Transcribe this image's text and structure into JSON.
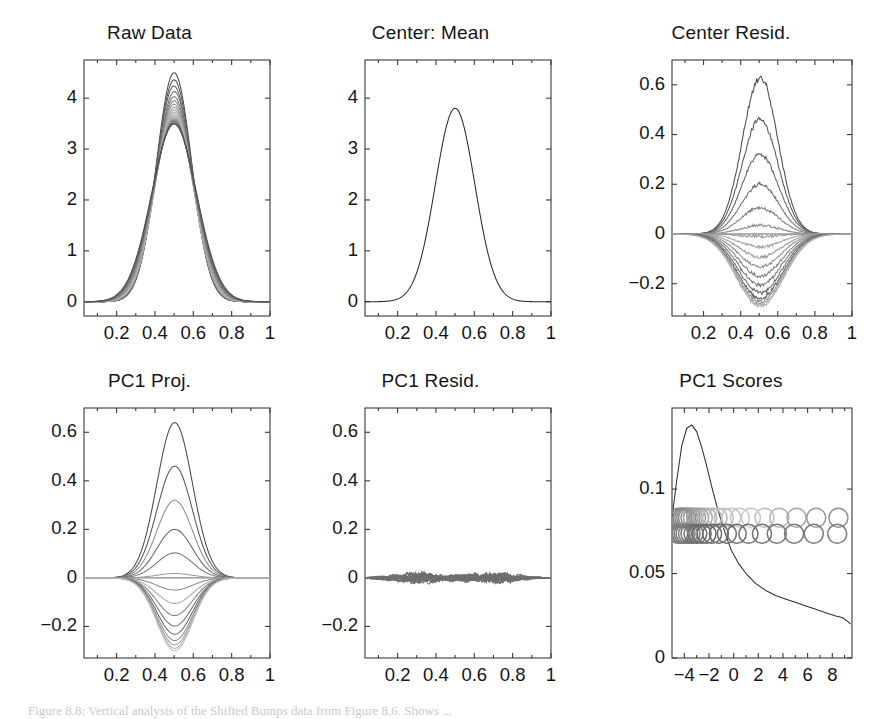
{
  "figure": {
    "caption": "Figure 8.8: Vertical analysis of the Shifted Bumps data from Figure 8.6. Shows ..."
  },
  "chart_data": [
    {
      "id": "raw-data",
      "type": "line",
      "title": "Raw Data",
      "xlabel": "",
      "ylabel": "",
      "xlim": [
        0.03,
        1.0
      ],
      "ylim": [
        -0.28,
        4.75
      ],
      "xticks": [
        0.2,
        0.4,
        0.6,
        0.8,
        1
      ],
      "xticklabels": [
        "0.2",
        "0.4",
        "0.6",
        "0.8",
        "1"
      ],
      "yticks": [
        0,
        1,
        2,
        3,
        4
      ],
      "yticklabels": [
        "0",
        "1",
        "2",
        "3",
        "4"
      ],
      "minor_xticks": [
        0.1,
        0.3,
        0.5,
        0.7,
        0.9
      ],
      "grid": false,
      "legend": "none",
      "description": "Family of ~20 overlapping Gaussian-like bump curves centered at x=0.5, peak heights ranging 3.5 to 4.5, baseline 0.",
      "series": [
        {
          "name": "curve01",
          "peak": 4.5,
          "center": 0.5,
          "width": 0.092,
          "gray": "#4a4a4a"
        },
        {
          "name": "curve02",
          "peak": 4.36,
          "center": 0.5,
          "width": 0.093,
          "gray": "#555555"
        },
        {
          "name": "curve03",
          "peak": 4.24,
          "center": 0.499,
          "width": 0.094,
          "gray": "#626262"
        },
        {
          "name": "curve04",
          "peak": 4.13,
          "center": 0.501,
          "width": 0.095,
          "gray": "#6e6e6e"
        },
        {
          "name": "curve05",
          "peak": 4.03,
          "center": 0.5,
          "width": 0.096,
          "gray": "#7a7a7a"
        },
        {
          "name": "curve06",
          "peak": 3.95,
          "center": 0.5,
          "width": 0.097,
          "gray": "#868686"
        },
        {
          "name": "curve07",
          "peak": 3.88,
          "center": 0.499,
          "width": 0.098,
          "gray": "#929292"
        },
        {
          "name": "curve08",
          "peak": 3.82,
          "center": 0.501,
          "width": 0.099,
          "gray": "#9d9d9d"
        },
        {
          "name": "curve09",
          "peak": 3.77,
          "center": 0.5,
          "width": 0.1,
          "gray": "#a8a8a8"
        },
        {
          "name": "curve10",
          "peak": 3.73,
          "center": 0.5,
          "width": 0.101,
          "gray": "#b3b3b3"
        },
        {
          "name": "curve11",
          "peak": 3.7,
          "center": 0.5,
          "width": 0.102,
          "gray": "#bcbcbc"
        },
        {
          "name": "curve12",
          "peak": 3.67,
          "center": 0.5,
          "width": 0.103,
          "gray": "#b0b0b0"
        },
        {
          "name": "curve13",
          "peak": 3.64,
          "center": 0.5,
          "width": 0.104,
          "gray": "#a4a4a4"
        },
        {
          "name": "curve14",
          "peak": 3.61,
          "center": 0.5,
          "width": 0.106,
          "gray": "#989898"
        },
        {
          "name": "curve15",
          "peak": 3.58,
          "center": 0.5,
          "width": 0.108,
          "gray": "#8c8c8c"
        },
        {
          "name": "curve16",
          "peak": 3.56,
          "center": 0.5,
          "width": 0.11,
          "gray": "#808080"
        },
        {
          "name": "curve17",
          "peak": 3.54,
          "center": 0.5,
          "width": 0.112,
          "gray": "#747474"
        },
        {
          "name": "curve18",
          "peak": 3.52,
          "center": 0.5,
          "width": 0.114,
          "gray": "#686868"
        },
        {
          "name": "curve19",
          "peak": 3.5,
          "center": 0.5,
          "width": 0.116,
          "gray": "#5c5c5c"
        },
        {
          "name": "curve20",
          "peak": 3.49,
          "center": 0.5,
          "width": 0.118,
          "gray": "#4f4f4f"
        }
      ]
    },
    {
      "id": "center-mean",
      "type": "line",
      "title": "Center: Mean",
      "xlabel": "",
      "ylabel": "",
      "xlim": [
        0.03,
        1.0
      ],
      "ylim": [
        -0.28,
        4.75
      ],
      "xticks": [
        0.2,
        0.4,
        0.6,
        0.8,
        1
      ],
      "xticklabels": [
        "0.2",
        "0.4",
        "0.6",
        "0.8",
        "1"
      ],
      "yticks": [
        0,
        1,
        2,
        3,
        4
      ],
      "yticklabels": [
        "0",
        "1",
        "2",
        "3",
        "4"
      ],
      "minor_xticks": [
        0.1,
        0.3,
        0.5,
        0.7,
        0.9
      ],
      "grid": false,
      "legend": "none",
      "description": "Single mean curve, Gaussian bump centered at x=0.5 with peak 3.8.",
      "series": [
        {
          "name": "mean",
          "peak": 3.8,
          "center": 0.5,
          "width": 0.103,
          "gray": "#2a2a2a"
        }
      ]
    },
    {
      "id": "center-resid",
      "type": "line",
      "title": "Center Resid.",
      "xlabel": "",
      "ylabel": "",
      "xlim": [
        0.03,
        1.0
      ],
      "ylim": [
        -0.33,
        0.7
      ],
      "xticks": [
        0.2,
        0.4,
        0.6,
        0.8,
        1
      ],
      "xticklabels": [
        "0.2",
        "0.4",
        "0.6",
        "0.8",
        "1"
      ],
      "yticks": [
        -0.2,
        0,
        0.2,
        0.4,
        0.6
      ],
      "yticklabels": [
        "−0.2",
        "0",
        "0.2",
        "0.4",
        "0.6"
      ],
      "minor_xticks": [
        0.1,
        0.3,
        0.5,
        0.7,
        0.9
      ],
      "grid": false,
      "legend": "none",
      "zeroline": true,
      "noisy": true,
      "description": "Mean-centered residual curves, amplitudes from +0.63 down to -0.29, noisy/wobbly bumps centered near x=0.5.",
      "series": [
        {
          "name": "r01",
          "peak": 0.63,
          "center": 0.505,
          "width": 0.095,
          "gray": "#4d4d4d"
        },
        {
          "name": "r02",
          "peak": 0.462,
          "center": 0.505,
          "width": 0.097,
          "gray": "#585858"
        },
        {
          "name": "r03",
          "peak": 0.32,
          "center": 0.505,
          "width": 0.099,
          "gray": "#646464"
        },
        {
          "name": "r04",
          "peak": 0.2,
          "center": 0.505,
          "width": 0.101,
          "gray": "#707070"
        },
        {
          "name": "r05",
          "peak": 0.105,
          "center": 0.505,
          "width": 0.103,
          "gray": "#7d7d7d"
        },
        {
          "name": "r06",
          "peak": 0.035,
          "center": 0.505,
          "width": 0.105,
          "gray": "#8a8a8a"
        },
        {
          "name": "r07",
          "peak": -0.01,
          "center": 0.505,
          "width": 0.107,
          "gray": "#979797"
        },
        {
          "name": "r08",
          "peak": -0.052,
          "center": 0.505,
          "width": 0.109,
          "gray": "#a3a3a3"
        },
        {
          "name": "r09",
          "peak": -0.093,
          "center": 0.505,
          "width": 0.111,
          "gray": "#9a9a9a"
        },
        {
          "name": "r10",
          "peak": -0.132,
          "center": 0.505,
          "width": 0.113,
          "gray": "#8e8e8e"
        },
        {
          "name": "r11",
          "peak": -0.17,
          "center": 0.505,
          "width": 0.115,
          "gray": "#828282"
        },
        {
          "name": "r12",
          "peak": -0.205,
          "center": 0.505,
          "width": 0.117,
          "gray": "#757575"
        },
        {
          "name": "r13",
          "peak": -0.235,
          "center": 0.505,
          "width": 0.119,
          "gray": "#696969"
        },
        {
          "name": "r14",
          "peak": -0.258,
          "center": 0.505,
          "width": 0.121,
          "gray": "#5d5d5d"
        },
        {
          "name": "r15",
          "peak": -0.272,
          "center": 0.505,
          "width": 0.123,
          "gray": "#8f8f8f"
        },
        {
          "name": "r16",
          "peak": -0.283,
          "center": 0.505,
          "width": 0.125,
          "gray": "#a0a0a0"
        },
        {
          "name": "r17",
          "peak": -0.29,
          "center": 0.505,
          "width": 0.127,
          "gray": "#b0b0b0"
        }
      ]
    },
    {
      "id": "pc1-proj",
      "type": "line",
      "title": "PC1 Proj.",
      "xlabel": "",
      "ylabel": "",
      "xlim": [
        0.03,
        1.0
      ],
      "ylim": [
        -0.33,
        0.7
      ],
      "xticks": [
        0.2,
        0.4,
        0.6,
        0.8,
        1
      ],
      "xticklabels": [
        "0.2",
        "0.4",
        "0.6",
        "0.8",
        "1"
      ],
      "yticks": [
        -0.2,
        0,
        0.2,
        0.4,
        0.6
      ],
      "yticklabels": [
        "−0.2",
        "0",
        "0.2",
        "0.4",
        "0.6"
      ],
      "minor_xticks": [
        0.1,
        0.3,
        0.5,
        0.7,
        0.9
      ],
      "grid": false,
      "legend": "none",
      "zeroline": true,
      "noisy": false,
      "description": "Smooth rank-one PC1 projections: scaled copies of one eigenfunction, peaks 0.64 to -0.30.",
      "series": [
        {
          "name": "p01",
          "peak": 0.64,
          "center": 0.503,
          "width": 0.093,
          "gray": "#4a4a4a"
        },
        {
          "name": "p02",
          "peak": 0.46,
          "center": 0.503,
          "width": 0.093,
          "gray": "#555555"
        },
        {
          "name": "p03",
          "peak": 0.32,
          "center": 0.503,
          "width": 0.093,
          "gray": "#8d8d8d"
        },
        {
          "name": "p04",
          "peak": 0.2,
          "center": 0.503,
          "width": 0.093,
          "gray": "#666666"
        },
        {
          "name": "p05",
          "peak": 0.103,
          "center": 0.503,
          "width": 0.093,
          "gray": "#757575"
        },
        {
          "name": "p06",
          "peak": 0.018,
          "center": 0.503,
          "width": 0.093,
          "gray": "#9c9c9c"
        },
        {
          "name": "p07",
          "peak": -0.05,
          "center": 0.503,
          "width": 0.093,
          "gray": "#8a8a8a"
        },
        {
          "name": "p08",
          "peak": -0.105,
          "center": 0.503,
          "width": 0.093,
          "gray": "#a6a6a6"
        },
        {
          "name": "p09",
          "peak": -0.155,
          "center": 0.503,
          "width": 0.093,
          "gray": "#7e7e7e"
        },
        {
          "name": "p10",
          "peak": -0.198,
          "center": 0.503,
          "width": 0.093,
          "gray": "#6f6f6f"
        },
        {
          "name": "p11",
          "peak": -0.232,
          "center": 0.503,
          "width": 0.093,
          "gray": "#636363"
        },
        {
          "name": "p12",
          "peak": -0.258,
          "center": 0.503,
          "width": 0.093,
          "gray": "#8b8b8b"
        },
        {
          "name": "p13",
          "peak": -0.276,
          "center": 0.503,
          "width": 0.093,
          "gray": "#9e9e9e"
        },
        {
          "name": "p14",
          "peak": -0.29,
          "center": 0.503,
          "width": 0.093,
          "gray": "#aeaeae"
        },
        {
          "name": "p15",
          "peak": -0.3,
          "center": 0.503,
          "width": 0.093,
          "gray": "#bdbdbd"
        }
      ]
    },
    {
      "id": "pc1-resid",
      "type": "line",
      "title": "PC1 Resid.",
      "xlabel": "",
      "ylabel": "",
      "xlim": [
        0.03,
        1.0
      ],
      "ylim": [
        -0.33,
        0.7
      ],
      "xticks": [
        0.2,
        0.4,
        0.6,
        0.8,
        1
      ],
      "xticklabels": [
        "0.2",
        "0.4",
        "0.6",
        "0.8",
        "1"
      ],
      "yticks": [
        -0.2,
        0,
        0.2,
        0.4,
        0.6
      ],
      "yticklabels": [
        "−0.2",
        "0",
        "0.2",
        "0.4",
        "0.6"
      ],
      "minor_xticks": [
        0.1,
        0.3,
        0.5,
        0.7,
        0.9
      ],
      "grid": false,
      "legend": "none",
      "zeroline": true,
      "description": "Small residuals after removing PC1: tangled noise band confined near y=0, two lobes of activity around x=0.3 and x=0.7, max amplitude ~0.03.",
      "residual_band": {
        "amplitude": 0.03,
        "lobe_centers": [
          0.3,
          0.7
        ],
        "lobe_width": 0.13,
        "n_curves": 18,
        "gray": "#6e6e6e"
      }
    },
    {
      "id": "pc1-scores",
      "type": "scatter",
      "title": "PC1 Scores",
      "xlabel": "",
      "ylabel": "",
      "xlim": [
        -5.0,
        9.6
      ],
      "ylim": [
        0,
        0.148
      ],
      "xticks": [
        -4,
        -2,
        0,
        2,
        4,
        6,
        8
      ],
      "xticklabels": [
        "−4",
        "−2",
        "0",
        "2",
        "4",
        "6",
        "8"
      ],
      "yticks": [
        0,
        0.05,
        0.1
      ],
      "yticklabels": [
        "0",
        "0.05",
        "0.1"
      ],
      "minor_xticks": [
        -3,
        -1,
        1,
        3,
        5,
        7,
        9
      ],
      "grid": false,
      "legend": "none",
      "description": "Kernel density estimate curve of PC1 scores (peak ~0.138 near x=-3, decaying to ~0.02 at x=9) with two jittered rows of open circles marking individual scores, dense at left.",
      "density_curve": {
        "x": [
          -5.0,
          -4.6,
          -4.2,
          -3.8,
          -3.4,
          -3.0,
          -2.6,
          -2.2,
          -1.8,
          -1.4,
          -1.0,
          -0.6,
          -0.2,
          0.4,
          1.0,
          1.8,
          2.6,
          3.4,
          4.2,
          5.0,
          5.8,
          6.6,
          7.4,
          8.2,
          8.8,
          9.2,
          9.5
        ],
        "y": [
          0.083,
          0.106,
          0.126,
          0.136,
          0.138,
          0.134,
          0.125,
          0.114,
          0.102,
          0.091,
          0.081,
          0.072,
          0.064,
          0.056,
          0.05,
          0.044,
          0.04,
          0.037,
          0.035,
          0.033,
          0.031,
          0.029,
          0.027,
          0.025,
          0.024,
          0.022,
          0.02
        ]
      },
      "points_row_upper": {
        "y": 0.083,
        "x": [
          -4.45,
          -4.3,
          -4.15,
          -4.0,
          -3.85,
          -3.7,
          -3.5,
          -3.3,
          -3.05,
          -2.8,
          -2.5,
          -2.15,
          -1.75,
          -1.3,
          -0.8,
          -0.2,
          0.5,
          1.4,
          2.5,
          3.7,
          5.1,
          6.7,
          8.5
        ],
        "grays": [
          "#8a8a8a",
          "#8a8a8a",
          "#8a8a8a",
          "#8a8a8a",
          "#8a8a8a",
          "#8a8a8a",
          "#909090",
          "#969696",
          "#9c9c9c",
          "#a2a2a2",
          "#a8a8a8",
          "#aeaeae",
          "#b4b4b4",
          "#bababa",
          "#c0c0c0",
          "#c4c4c4",
          "#c8c8c8",
          "#c9c9c9",
          "#c0c0c0",
          "#b4b4b4",
          "#a8a8a8",
          "#9c9c9c",
          "#909090"
        ]
      },
      "points_row_lower": {
        "y": 0.0735,
        "x": [
          -4.5,
          -4.35,
          -4.2,
          -4.05,
          -3.9,
          -3.7,
          -3.5,
          -3.25,
          -2.95,
          -2.6,
          -2.2,
          -1.75,
          -1.2,
          -0.55,
          0.25,
          1.2,
          2.3,
          3.5,
          4.9,
          6.5,
          8.4
        ],
        "grays": [
          "#7e7e7e",
          "#7e7e7e",
          "#7e7e7e",
          "#7e7e7e",
          "#7e7e7e",
          "#7a7a7a",
          "#767676",
          "#727272",
          "#6e6e6e",
          "#6a6a6a",
          "#696969",
          "#696969",
          "#6b6b6b",
          "#6d6d6d",
          "#6f6f6f",
          "#717171",
          "#737373",
          "#757575",
          "#777777",
          "#797979",
          "#7b7b7b"
        ]
      },
      "point_radius_px": 9.5
    }
  ]
}
